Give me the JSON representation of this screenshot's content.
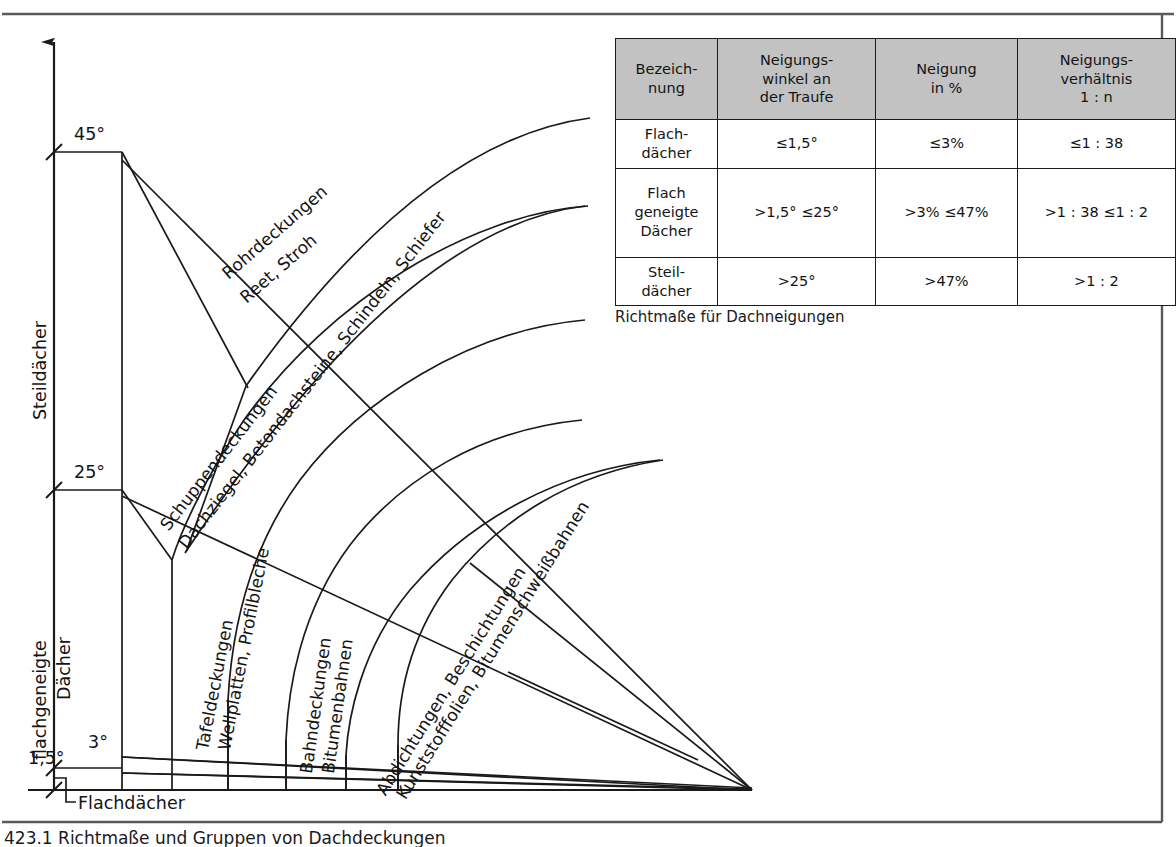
{
  "figure": {
    "caption": "423.1  Richtmaße und Gruppen von Dachdeckungen",
    "axis": {
      "group_steep": "Steildächer",
      "group_lowpitch_line1": "flachgeneigte",
      "group_lowpitch_line2": "Dächer",
      "group_flat": "Flachdächer",
      "tick_45": "45°",
      "tick_25": "25°",
      "tick_3": "3°",
      "tick_1_5": "1,5°"
    },
    "bands": [
      {
        "id": "rohrdeckungen",
        "line1": "Rohrdeckungen",
        "line2": "Reet, Stroh"
      },
      {
        "id": "schuppendeckungen",
        "line1": "Schuppendeckungen",
        "line2": "Dachziegel, Betondachsteine, Schindeln, Schiefer"
      },
      {
        "id": "tafeldeckungen",
        "line1": "Tafeldeckungen",
        "line2": "Wellplatten, Profilbleche"
      },
      {
        "id": "bahndeckungen",
        "line1": "Bahndeckungen",
        "line2": "Bitumenbahnen"
      },
      {
        "id": "abdichtungen",
        "line1": "Abdichtungen, Beschichtungen",
        "line2": "Kunststofffolien, Bitumenschweißbahnen"
      }
    ]
  },
  "table": {
    "caption": "Richtmaße für Dachneigungen",
    "headers": [
      "Bezeich-\nnung",
      "Neigungs-\nwinkel an\nder Traufe",
      "Neigung\nin %",
      "Neigungs-\nverhältnis\n1 : n"
    ],
    "header_fill": "#c2c2c2",
    "rows": [
      {
        "name": "Flach-\ndächer",
        "angle": "≤1,5°",
        "percent": "≤3%",
        "ratio": "≤1 : 38"
      },
      {
        "name": "Flach\ngeneigte\nDächer",
        "angle": ">1,5°  ≤25°",
        "percent": ">3%  ≤47%",
        "ratio": ">1 : 38  ≤1 : 2"
      },
      {
        "name": "Steil-\ndächer",
        "angle": ">25°",
        "percent": ">47%",
        "ratio": ">1 : 2"
      }
    ]
  },
  "chart_data": {
    "type": "diagram",
    "title": "Richtmaße und Gruppen von Dachdeckungen",
    "apex": {
      "x": 752,
      "y": 790
    },
    "angles_deg": [
      45,
      25,
      3,
      1.5
    ],
    "categories": [
      "Flachdächer",
      "flachgeneigte Dächer",
      "Steildächer"
    ],
    "ranges": [
      {
        "name": "Flachdächer",
        "angle_max_deg": 1.5,
        "percent_max": 3,
        "ratio": "1 : 38"
      },
      {
        "name": "flachgeneigte Dächer",
        "angle_min_deg": 1.5,
        "angle_max_deg": 25,
        "percent_min": 3,
        "percent_max": 47
      },
      {
        "name": "Steildächer",
        "angle_min_deg": 25,
        "percent_min": 47
      }
    ]
  },
  "style": {
    "stroke": "#1a1a1a",
    "background": "#ffffff"
  }
}
